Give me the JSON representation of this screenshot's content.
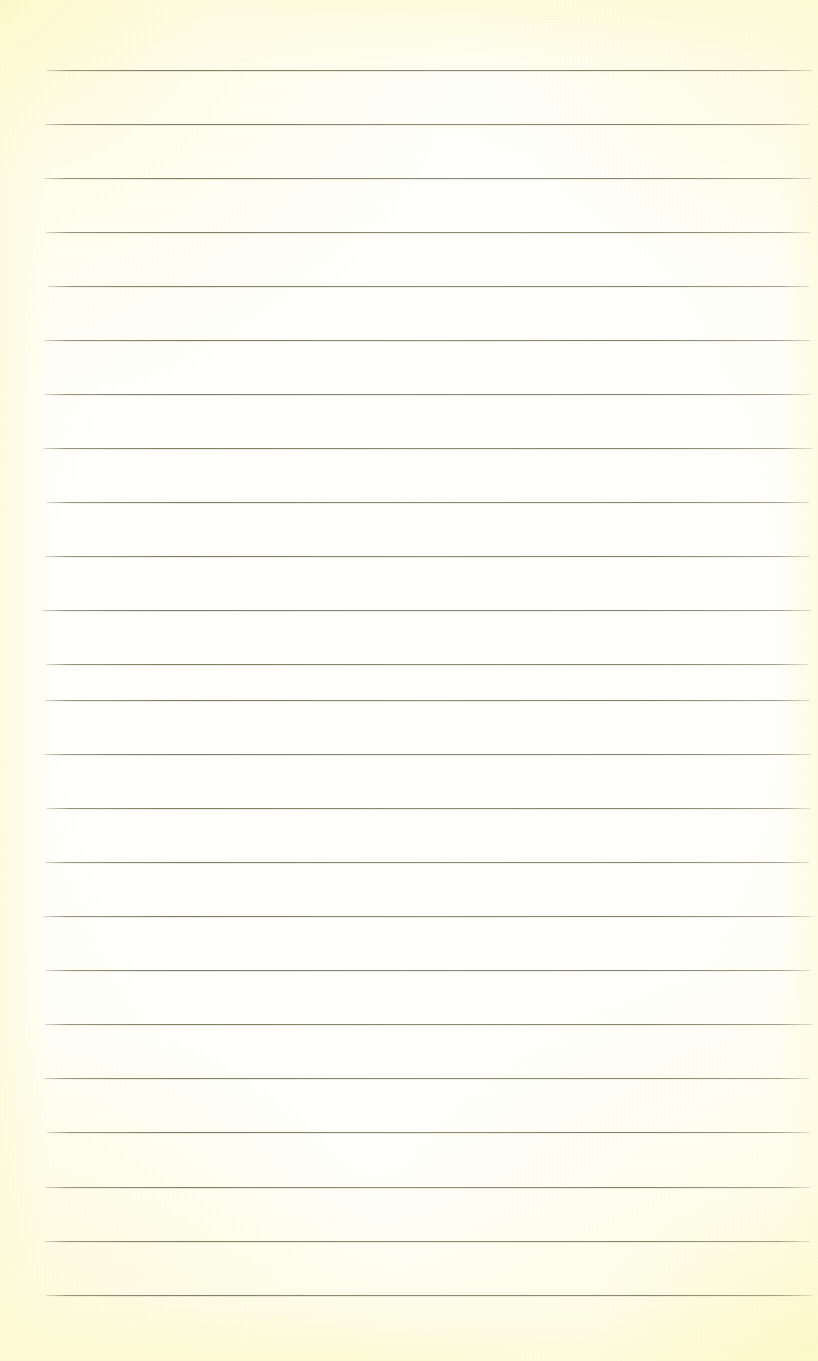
{
  "document": {
    "kind": "scanned-ruled-notebook-page",
    "title": "Blank ruled notebook page",
    "has_visible_text": false,
    "visible_text": "",
    "width_px": 818,
    "height_px": 1361
  },
  "paper": {
    "base_color": "#fffff5",
    "center_color": "#fffffd",
    "edge_color": "#fbf8d4",
    "corner_tint_color": "#fdf9cd",
    "grain_opacity": 0.5
  },
  "ruling": {
    "line_color": "#76775a",
    "line_color_faded": "#a8a88c",
    "line_count": 24,
    "line_thickness_px": 1,
    "line_spacing_px": 54,
    "first_line_y_px": 70,
    "last_line_y_px": 1295,
    "left_margin_px": 45,
    "right_margin_px": 810,
    "lines": [
      {
        "index": 1,
        "y": 70,
        "x_start": 47,
        "x_end": 812
      },
      {
        "index": 2,
        "y": 124,
        "x_start": 45,
        "x_end": 810
      },
      {
        "index": 3,
        "y": 178,
        "x_start": 44,
        "x_end": 811
      },
      {
        "index": 4,
        "y": 232,
        "x_start": 46,
        "x_end": 810
      },
      {
        "index": 5,
        "y": 286,
        "x_start": 48,
        "x_end": 809
      },
      {
        "index": 6,
        "y": 340,
        "x_start": 44,
        "x_end": 811
      },
      {
        "index": 7,
        "y": 394,
        "x_start": 45,
        "x_end": 810
      },
      {
        "index": 8,
        "y": 448,
        "x_start": 43,
        "x_end": 812
      },
      {
        "index": 9,
        "y": 502,
        "x_start": 47,
        "x_end": 809
      },
      {
        "index": 10,
        "y": 556,
        "x_start": 45,
        "x_end": 810
      },
      {
        "index": 11,
        "y": 610,
        "x_start": 42,
        "x_end": 811
      },
      {
        "index": 12,
        "y": 664,
        "x_start": 46,
        "x_end": 808
      },
      {
        "index": 13,
        "y": 700,
        "x_start": 45,
        "x_end": 810
      },
      {
        "index": 14,
        "y": 754,
        "x_start": 44,
        "x_end": 811
      },
      {
        "index": 15,
        "y": 808,
        "x_start": 47,
        "x_end": 810
      },
      {
        "index": 16,
        "y": 862,
        "x_start": 45,
        "x_end": 809
      },
      {
        "index": 17,
        "y": 916,
        "x_start": 43,
        "x_end": 811
      },
      {
        "index": 18,
        "y": 970,
        "x_start": 46,
        "x_end": 810
      },
      {
        "index": 19,
        "y": 1024,
        "x_start": 45,
        "x_end": 812
      },
      {
        "index": 20,
        "y": 1078,
        "x_start": 44,
        "x_end": 809
      },
      {
        "index": 21,
        "y": 1132,
        "x_start": 47,
        "x_end": 810
      },
      {
        "index": 22,
        "y": 1187,
        "x_start": 45,
        "x_end": 811
      },
      {
        "index": 23,
        "y": 1241,
        "x_start": 44,
        "x_end": 810
      },
      {
        "index": 24,
        "y": 1295,
        "x_start": 46,
        "x_end": 812
      }
    ]
  }
}
